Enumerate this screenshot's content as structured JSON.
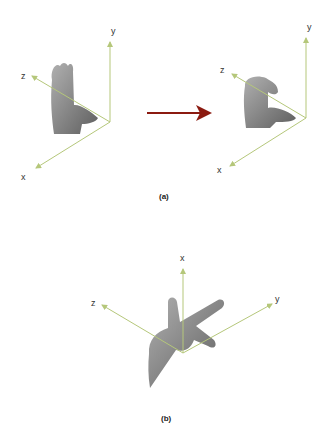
{
  "panel_a": {
    "caption": "(a)",
    "left_axes": {
      "x_label": "x",
      "y_label": "y",
      "z_label": "z"
    },
    "right_axes": {
      "x_label": "x",
      "y_label": "y",
      "z_label": "z"
    },
    "transition_arrow": "arrow-right-icon"
  },
  "panel_b": {
    "caption": "(b)",
    "axes": {
      "x_label": "x",
      "y_label": "y",
      "z_label": "z"
    }
  },
  "colors": {
    "axis": "#b5c77a",
    "arrow": "#8b1a10",
    "hand": "#8a8a8a",
    "text": "#333333"
  }
}
